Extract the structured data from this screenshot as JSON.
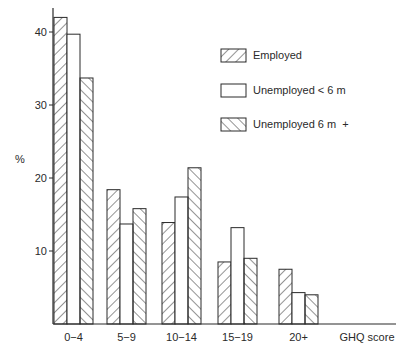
{
  "chart_data": {
    "type": "bar",
    "title": "",
    "xlabel": "GHQ score",
    "ylabel": "%",
    "ylim": [
      0,
      44
    ],
    "yticks": [
      10,
      20,
      30,
      40
    ],
    "grid": false,
    "legend_position": "upper-right",
    "categories": [
      "0−4",
      "5−9",
      "10−14",
      "15−19",
      "20+"
    ],
    "series": [
      {
        "name": "Employed",
        "pattern": "hatch-forward",
        "values": [
          42.0,
          18.4,
          13.9,
          8.5,
          7.5
        ]
      },
      {
        "name": "Unemployed < 6 m",
        "pattern": "none",
        "values": [
          39.7,
          13.7,
          17.4,
          13.2,
          4.3
        ]
      },
      {
        "name": "Unemployed 6 m  +",
        "pattern": "hatch-backward",
        "values": [
          33.7,
          15.8,
          21.4,
          9.0,
          4.0
        ]
      }
    ]
  },
  "axis": {
    "y_label": "%",
    "x_label": "GHQ score",
    "y_ticks": [
      "10",
      "20",
      "30",
      "40"
    ]
  },
  "legend": {
    "items": [
      "Employed",
      "Unemployed < 6 m",
      "Unemployed 6 m  +"
    ]
  },
  "colors": {
    "ink": "#2a2a2a",
    "background": "#ffffff"
  }
}
